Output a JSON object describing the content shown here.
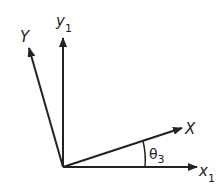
{
  "diagram": {
    "type": "coordinate-rotation",
    "origin": [
      63,
      167
    ],
    "axes": [
      {
        "id": "x1",
        "label": "x",
        "subscript": "1",
        "tip": [
          197,
          167
        ],
        "label_pos": [
          199,
          176
        ]
      },
      {
        "id": "y1",
        "label": "y",
        "subscript": "1",
        "tip": [
          63,
          38
        ],
        "label_pos": [
          56,
          26
        ]
      },
      {
        "id": "X",
        "label": "X",
        "subscript": "",
        "tip": [
          182,
          128
        ],
        "label_pos": [
          185,
          134
        ]
      },
      {
        "id": "Y",
        "label": "Y",
        "subscript": "",
        "tip": [
          29,
          48
        ],
        "label_pos": [
          20,
          42
        ]
      }
    ],
    "angle": {
      "label": "θ",
      "subscript": "3",
      "label_pos": [
        150,
        160
      ]
    },
    "stroke_color": "#222222"
  }
}
